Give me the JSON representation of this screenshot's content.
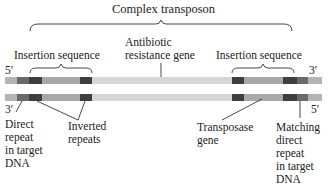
{
  "title": "Complex transposon",
  "top_labels": {
    "insertion_left": "Insertion sequence",
    "antibiotic": "Antibiotic\nresistance gene",
    "insertion_right": "Insertion sequence"
  },
  "strand_ends": {
    "top_left": "5′",
    "top_right": "3′",
    "bottom_left": "3′",
    "bottom_right": "5′"
  },
  "bottom_labels": {
    "direct_repeat": "Direct\nrepeat\nin target\nDNA",
    "inverted_repeats": "Inverted\nrepeats",
    "transposase": "Transposase\ngene",
    "matching_repeat": "Matching\ndirect\nrepeat\nin target\nDNA"
  },
  "colors": {
    "target_dna": "#b4b4b4",
    "direct_repeat": "#6a6a6a",
    "inverted_repeat": "#3e3e3e",
    "insertion_body": "#a8a8a8",
    "resistance_gene": "#d6d6d6",
    "line": "#333333"
  },
  "segments": [
    {
      "name": "target-dna-left",
      "x": 5,
      "w": 12,
      "color": "#b4b4b4"
    },
    {
      "name": "direct-repeat-left",
      "x": 17,
      "w": 12,
      "color": "#6a6a6a"
    },
    {
      "name": "inverted-repeat-1",
      "x": 29,
      "w": 13,
      "color": "#3e3e3e"
    },
    {
      "name": "insertion-body-left",
      "x": 42,
      "w": 38,
      "color": "#a8a8a8"
    },
    {
      "name": "inverted-repeat-2",
      "x": 80,
      "w": 12,
      "color": "#3e3e3e"
    },
    {
      "name": "resistance-gene",
      "x": 92,
      "w": 140,
      "color": "#d6d6d6"
    },
    {
      "name": "inverted-repeat-3",
      "x": 232,
      "w": 12,
      "color": "#3e3e3e"
    },
    {
      "name": "insertion-body-right",
      "x": 244,
      "w": 39,
      "color": "#a8a8a8"
    },
    {
      "name": "inverted-repeat-4",
      "x": 283,
      "w": 14,
      "color": "#3e3e3e"
    },
    {
      "name": "direct-repeat-right",
      "x": 297,
      "w": 11,
      "color": "#6a6a6a"
    },
    {
      "name": "target-dna-right",
      "x": 308,
      "w": 14,
      "color": "#b4b4b4"
    }
  ]
}
